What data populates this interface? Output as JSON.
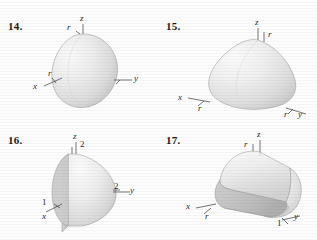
{
  "page": {
    "background": "#fdfdfd",
    "kind": "textbook-exercise-figures"
  },
  "figures": [
    {
      "number": "14.",
      "shape": "egg-shaped solid of revolution (sphere-like dome) sitting on origin",
      "labels": {
        "z_axis": "z",
        "r_top": "r",
        "x_axis": "x",
        "r_left": "r",
        "y_axis": "y"
      }
    },
    {
      "number": "15.",
      "shape": "teardrop / paraboloid dome solid",
      "labels": {
        "z_axis": "z",
        "r_right": "r",
        "x_axis": "x",
        "r_left": "r",
        "r_bottom": "r",
        "y_axis": "y"
      }
    },
    {
      "number": "16.",
      "shape": "half hemisphere (flat vertical face toward viewer, radius 2, height 2)",
      "labels": {
        "z_axis": "z",
        "z_value": "2",
        "x_axis": "x",
        "x_value": "1",
        "y_axis": "y",
        "y_value": "2"
      }
    },
    {
      "number": "17.",
      "shape": "half cylinder / quonset hut solid lying along y-axis",
      "labels": {
        "z_axis": "z",
        "r_top": "r",
        "x_axis": "x",
        "r_left": "r",
        "y_axis": "y",
        "y_value": "1"
      }
    }
  ],
  "colors": {
    "ink": "#1a1a1a",
    "label_ink": "#2b2b2b",
    "axis": "#3a3a3a",
    "surface_light": "#f2f2f2",
    "surface_mid": "#d8d8d8",
    "surface_dark": "#b4b4b4",
    "outline": "#8f8f8f"
  }
}
